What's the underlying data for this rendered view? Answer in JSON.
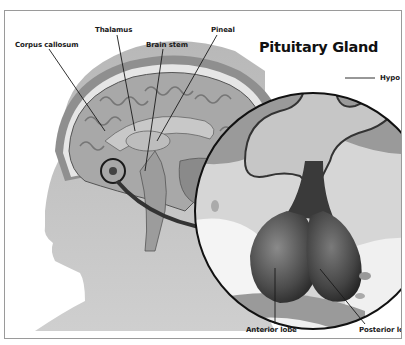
{
  "diagram": {
    "title": "Pituitary Gland",
    "labels": {
      "corpus_callosum": "Corpus callosum",
      "thalamus": "Thalamus",
      "brain_stem": "Brain stem",
      "pineal": "Pineal",
      "hypothalamus": "Hypo",
      "anterior_lobe": "Anterior lobe",
      "posterior_lobe": "Posterior lo"
    },
    "colors": {
      "head_silhouette": "#bdbdbd",
      "brain": "#9e9e9e",
      "gland": "#4a4a4a",
      "line": "#1a1a1a",
      "border": "#9a9a9a"
    }
  }
}
